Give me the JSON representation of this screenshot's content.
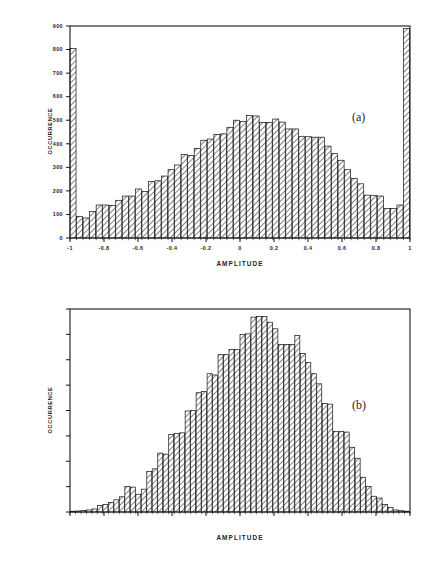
{
  "figure": {
    "background": "#ffffff",
    "ink": "#1a1a1a"
  },
  "chart_data": [
    {
      "id": "panel-a",
      "type": "bar",
      "title": "",
      "panel_label": "(a)",
      "xlabel": "AMPLITUDE",
      "ylabel": "OCCURRENCE",
      "xlim": [
        -1.0,
        1.0
      ],
      "ylim": [
        0,
        900
      ],
      "xticks": [
        -1,
        -0.8,
        -0.6,
        -0.4,
        -0.2,
        0,
        0.2,
        0.4,
        0.6,
        0.8,
        1
      ],
      "xticklabels": [
        "-1",
        "-0.8",
        "-0.6",
        "-0.4",
        "-0.2",
        "0",
        "0.2",
        "0.4",
        "0.6",
        "0.8",
        "1"
      ],
      "yticks": [
        0,
        100,
        200,
        300,
        400,
        500,
        600,
        700,
        800,
        900
      ],
      "yticklabels": [
        "0",
        "100",
        "200",
        "300",
        "400",
        "500",
        "600",
        "700",
        "800",
        "900"
      ],
      "grid": false,
      "legend": "none",
      "bar_fill": "#ffffff",
      "bar_edge": "#111111",
      "bar_hatch": "diagonal",
      "n_bins": 52,
      "values": [
        805,
        92,
        85,
        112,
        140,
        140,
        138,
        160,
        178,
        178,
        208,
        198,
        240,
        243,
        263,
        290,
        310,
        355,
        350,
        380,
        415,
        420,
        440,
        442,
        470,
        500,
        495,
        520,
        518,
        490,
        490,
        505,
        492,
        463,
        463,
        430,
        430,
        428,
        428,
        390,
        358,
        330,
        290,
        252,
        230,
        182,
        180,
        178,
        125,
        125,
        140,
        890
      ]
    },
    {
      "id": "panel-b",
      "type": "bar",
      "title": "",
      "panel_label": "(b)",
      "xlabel": "AMPLITUDE",
      "ylabel": "OCCURRENCE",
      "xlim": [
        -3.0,
        3.0
      ],
      "ylim": [
        0,
        800
      ],
      "xticks": [
        -3,
        -2.4,
        -1.8,
        -1.2,
        -0.6,
        0,
        0.6,
        1.2,
        1.8,
        2.4,
        3
      ],
      "xticklabels": [
        "-3",
        "-2.4",
        "-1.8",
        "-1.2",
        "-0.6",
        "0",
        "0.6",
        "1.2",
        "1.8",
        "2.4",
        "3"
      ],
      "yticks": [
        0,
        100,
        200,
        300,
        400,
        500,
        600,
        700,
        800
      ],
      "yticklabels": [
        "0",
        "100",
        "200",
        "300",
        "400",
        "500",
        "600",
        "700",
        "800"
      ],
      "grid": false,
      "legend": "none",
      "bar_fill": "#ffffff",
      "bar_edge": "#111111",
      "bar_hatch": "diagonal",
      "n_bins": 52,
      "values": [
        3,
        4,
        6,
        8,
        12,
        26,
        30,
        38,
        48,
        60,
        100,
        98,
        70,
        90,
        160,
        170,
        232,
        228,
        305,
        310,
        312,
        398,
        400,
        470,
        475,
        545,
        540,
        620,
        620,
        640,
        640,
        700,
        702,
        768,
        770,
        770,
        748,
        722,
        660,
        660,
        660,
        695,
        625,
        590,
        545,
        505,
        428,
        425,
        318,
        318,
        315,
        255,
        212,
        137,
        100,
        62,
        55,
        30,
        18,
        8,
        5,
        3
      ]
    }
  ]
}
